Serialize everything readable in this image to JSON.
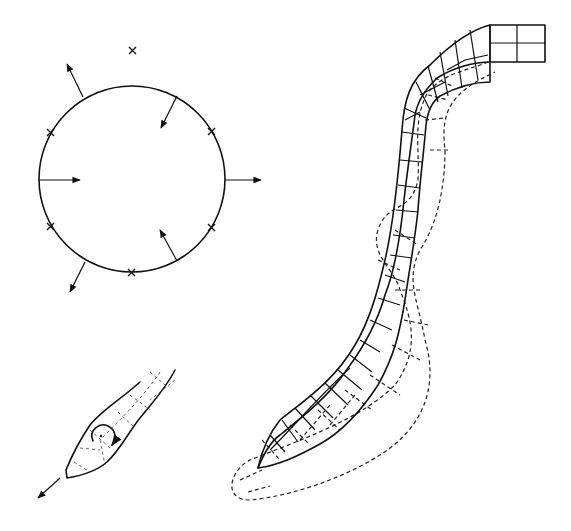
{
  "diagram": {
    "colors": {
      "line": "#111111",
      "background": "#ffffff"
    },
    "panels": [
      {
        "id": "circle",
        "label": "",
        "markers": 8,
        "arrows": 6
      },
      {
        "id": "snake",
        "label": "",
        "states": [
          "current-solid",
          "previous-dashed"
        ]
      },
      {
        "id": "tip",
        "label": "",
        "icons": [
          "rotation-arrow-icon",
          "translation-arrow-icon"
        ]
      }
    ]
  }
}
